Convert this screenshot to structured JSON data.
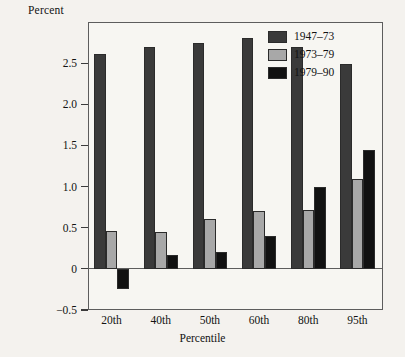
{
  "chart_data": {
    "type": "bar",
    "title": "",
    "ylabel": "Percent",
    "xlabel": "Percentile",
    "categories": [
      "20th",
      "40th",
      "50th",
      "60th",
      "80th",
      "95th"
    ],
    "series": [
      {
        "name": "1947–73",
        "color": "#3a3a3a",
        "values": [
          2.61,
          2.7,
          2.75,
          2.81,
          2.7,
          2.49
        ]
      },
      {
        "name": "1973–79",
        "color": "#a8a8a8",
        "values": [
          0.46,
          0.45,
          0.6,
          0.7,
          0.72,
          1.09
        ]
      },
      {
        "name": "1979–90",
        "color": "#111111",
        "values": [
          -0.25,
          0.17,
          0.21,
          0.4,
          1.0,
          1.44
        ]
      }
    ],
    "ylim": [
      -0.5,
      3.0
    ],
    "yticks": [
      -0.5,
      0,
      0.5,
      1.0,
      1.5,
      2.0,
      2.5
    ],
    "ytick_labels": [
      "−0.5",
      "0",
      "0.5",
      "1.0",
      "1.5",
      "2.0",
      "2.5"
    ],
    "grid": false,
    "zero_line": true,
    "legend_position": "top-right"
  }
}
